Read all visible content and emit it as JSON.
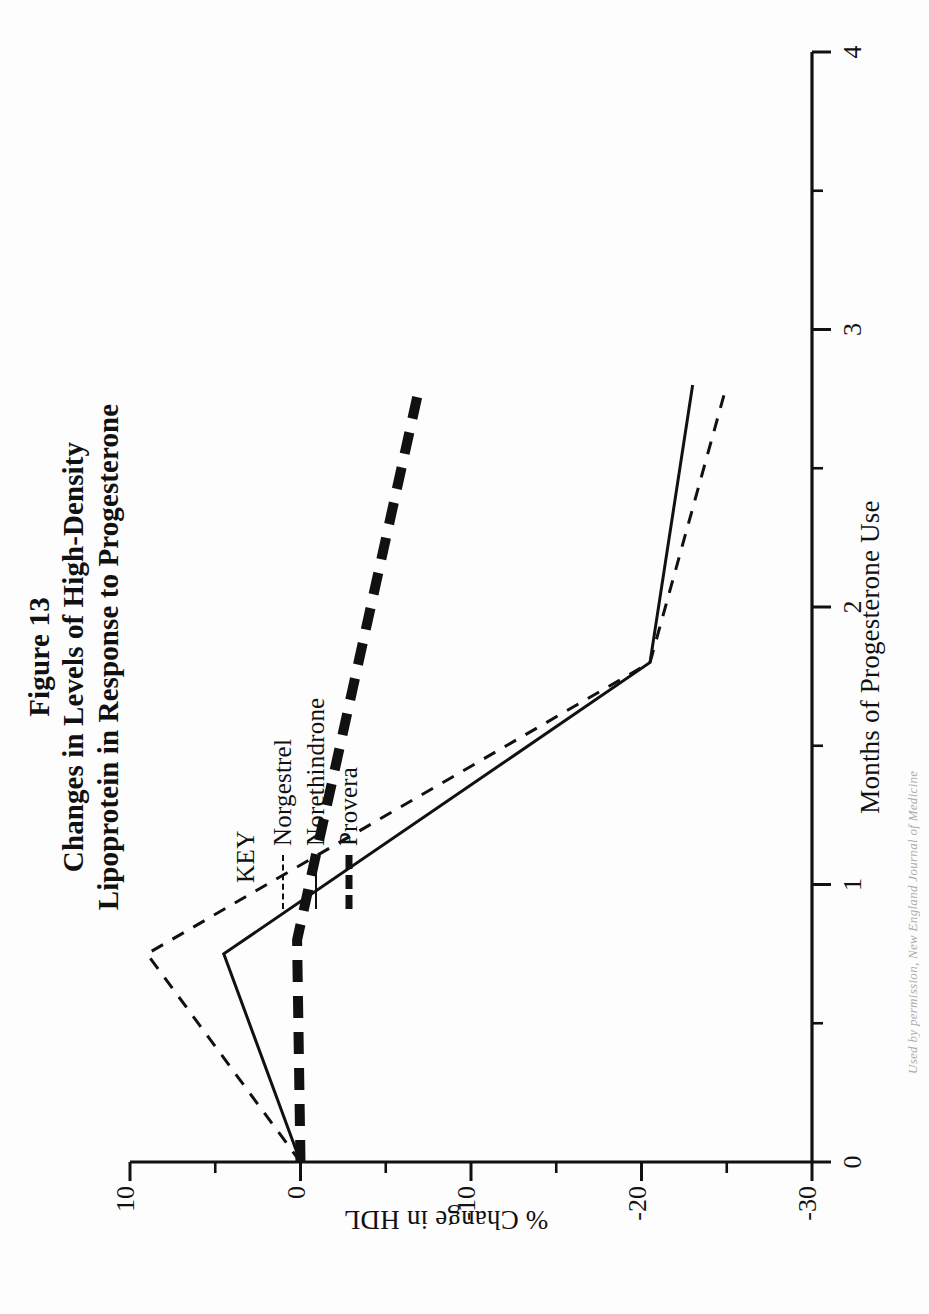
{
  "figure": {
    "number": "Figure 13",
    "title_line1": "Changes in Levels of High-Density",
    "title_line2": "Lipoprotein in Response to Progesterone",
    "credit": "Used by permission, New England Journal of Medicine"
  },
  "legend": {
    "heading": "KEY",
    "entries": [
      {
        "label": "Norgestrel",
        "style": "thin-dashed",
        "icon": "dashed-line-icon"
      },
      {
        "label": "Norethindrone",
        "style": "thin-solid",
        "icon": "solid-line-icon"
      },
      {
        "label": "Provera",
        "style": "thick-dashed",
        "icon": "thick-dashed-line-icon"
      }
    ]
  },
  "chart_data": {
    "type": "line",
    "title": "Changes in Levels of High-Density Lipoprotein in Response to Progesterone",
    "xlabel": "Months of Progesterone Use",
    "ylabel": "% Change in HDL",
    "xlim": [
      0,
      4
    ],
    "ylim": [
      -30,
      10
    ],
    "grid": false,
    "legend_position": "upper-right-inside",
    "x_ticks_major": [
      0,
      1,
      2,
      3,
      4
    ],
    "x_tick_labels": [
      "0",
      "1",
      "2",
      "3",
      "4"
    ],
    "x_ticks_minor": [
      0.5,
      1.5,
      2.5,
      3.5
    ],
    "y_ticks_major": [
      10,
      0,
      -10,
      -20,
      -30
    ],
    "y_tick_labels": [
      "10",
      "0",
      "-10",
      "-20",
      "-30"
    ],
    "y_ticks_minor": [
      5,
      -5,
      -15,
      -25
    ],
    "series": [
      {
        "name": "Norgestrel",
        "style": "thin-dashed",
        "x": [
          0,
          0.75,
          1.8,
          2.8
        ],
        "y": [
          0,
          9.0,
          -20.5,
          -25.0
        ]
      },
      {
        "name": "Norethindrone",
        "style": "thin-solid",
        "x": [
          0,
          0.75,
          1.8,
          2.8
        ],
        "y": [
          0,
          4.5,
          -20.5,
          -23.0
        ]
      },
      {
        "name": "Provera",
        "style": "thick-dashed",
        "x": [
          0,
          0.8,
          2.8
        ],
        "y": [
          0,
          0.2,
          -7.0
        ]
      }
    ]
  }
}
